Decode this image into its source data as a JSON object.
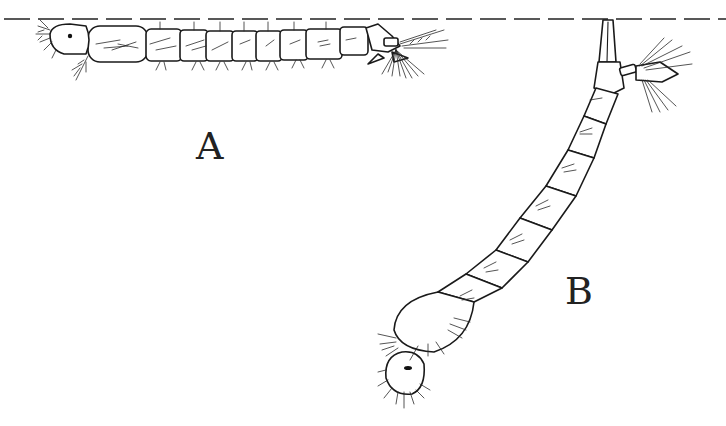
{
  "figure": {
    "type": "line-drawing",
    "water_surface": "dashed line",
    "panels": [
      {
        "id": "A",
        "label": "A",
        "description": "larva lying parallel beneath water surface"
      },
      {
        "id": "B",
        "label": "B",
        "description": "larva hanging at an angle from surface by siphon"
      }
    ],
    "colors": {
      "ink": "#1a1a1a",
      "background": "#ffffff"
    }
  }
}
